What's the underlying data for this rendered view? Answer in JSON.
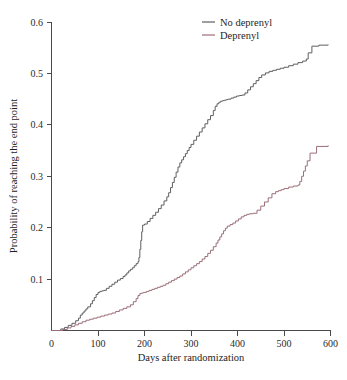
{
  "chart_data": {
    "type": "line",
    "title": "",
    "subtitle": "",
    "xlabel": "Days after randomization",
    "ylabel": "Probability of reaching the end point",
    "xlim": [
      0,
      600
    ],
    "ylim": [
      0,
      0.6
    ],
    "xticks": [
      0,
      100,
      200,
      300,
      400,
      500,
      600
    ],
    "xtick_labels": [
      "0",
      "100",
      "200",
      "300",
      "400",
      "500",
      "600"
    ],
    "yticks": [
      0.1,
      0.2,
      0.3,
      0.4,
      0.5,
      0.6
    ],
    "ytick_labels": [
      "0.1",
      "0.2",
      "0.3",
      "0.4",
      "0.5",
      "0.6"
    ],
    "grid": false,
    "legend_position": "top-right",
    "step_type": "post",
    "series": [
      {
        "name": "No deprenyl",
        "color": "#5f5f63",
        "x": [
          0,
          20,
          28,
          36,
          44,
          52,
          58,
          62,
          66,
          70,
          74,
          78,
          84,
          88,
          92,
          96,
          100,
          104,
          108,
          112,
          118,
          124,
          130,
          136,
          142,
          148,
          154,
          158,
          162,
          166,
          170,
          174,
          178,
          182,
          186,
          188,
          190,
          192,
          194,
          196,
          200,
          206,
          212,
          218,
          224,
          230,
          236,
          242,
          248,
          252,
          256,
          260,
          264,
          268,
          272,
          276,
          280,
          284,
          288,
          292,
          296,
          300,
          306,
          312,
          318,
          324,
          330,
          336,
          342,
          348,
          352,
          356,
          360,
          364,
          368,
          372,
          376,
          380,
          386,
          392,
          398,
          404,
          410,
          416,
          422,
          428,
          434,
          440,
          446,
          452,
          460,
          468,
          476,
          484,
          492,
          500,
          510,
          520,
          530,
          540,
          548,
          552,
          560,
          575,
          595
        ],
        "y": [
          0.0,
          0.003,
          0.006,
          0.01,
          0.014,
          0.019,
          0.024,
          0.03,
          0.034,
          0.038,
          0.042,
          0.046,
          0.052,
          0.058,
          0.064,
          0.07,
          0.074,
          0.076,
          0.077,
          0.078,
          0.082,
          0.086,
          0.09,
          0.094,
          0.098,
          0.101,
          0.105,
          0.108,
          0.112,
          0.116,
          0.119,
          0.122,
          0.126,
          0.13,
          0.134,
          0.142,
          0.158,
          0.175,
          0.192,
          0.205,
          0.207,
          0.212,
          0.218,
          0.224,
          0.23,
          0.237,
          0.244,
          0.252,
          0.26,
          0.268,
          0.278,
          0.288,
          0.298,
          0.308,
          0.318,
          0.326,
          0.332,
          0.338,
          0.344,
          0.35,
          0.356,
          0.362,
          0.37,
          0.378,
          0.386,
          0.394,
          0.402,
          0.41,
          0.418,
          0.428,
          0.436,
          0.441,
          0.444,
          0.446,
          0.447,
          0.448,
          0.449,
          0.45,
          0.452,
          0.454,
          0.456,
          0.457,
          0.458,
          0.462,
          0.468,
          0.474,
          0.48,
          0.486,
          0.492,
          0.497,
          0.501,
          0.504,
          0.506,
          0.508,
          0.51,
          0.512,
          0.515,
          0.518,
          0.521,
          0.524,
          0.528,
          0.54,
          0.553,
          0.555,
          0.556
        ]
      },
      {
        "name": "Deprenyl",
        "color": "#9b6f78",
        "x": [
          0,
          24,
          34,
          42,
          50,
          58,
          66,
          74,
          82,
          90,
          98,
          106,
          114,
          122,
          130,
          138,
          146,
          154,
          162,
          170,
          176,
          182,
          186,
          190,
          194,
          198,
          204,
          210,
          216,
          222,
          228,
          234,
          240,
          246,
          252,
          258,
          264,
          270,
          276,
          282,
          288,
          294,
          300,
          306,
          312,
          318,
          324,
          330,
          336,
          342,
          348,
          354,
          358,
          362,
          366,
          370,
          374,
          378,
          384,
          390,
          396,
          402,
          408,
          414,
          420,
          426,
          434,
          442,
          450,
          458,
          466,
          474,
          482,
          488,
          494,
          500,
          510,
          520,
          530,
          534,
          538,
          542,
          546,
          550,
          556,
          570,
          595
        ],
        "y": [
          0.0,
          0.002,
          0.005,
          0.008,
          0.011,
          0.014,
          0.017,
          0.02,
          0.022,
          0.024,
          0.026,
          0.028,
          0.03,
          0.032,
          0.034,
          0.037,
          0.04,
          0.043,
          0.046,
          0.05,
          0.056,
          0.062,
          0.068,
          0.072,
          0.073,
          0.074,
          0.076,
          0.078,
          0.08,
          0.082,
          0.084,
          0.086,
          0.088,
          0.091,
          0.094,
          0.097,
          0.1,
          0.103,
          0.106,
          0.11,
          0.114,
          0.118,
          0.122,
          0.126,
          0.13,
          0.134,
          0.139,
          0.144,
          0.15,
          0.156,
          0.163,
          0.17,
          0.176,
          0.182,
          0.188,
          0.194,
          0.199,
          0.203,
          0.206,
          0.209,
          0.213,
          0.217,
          0.221,
          0.224,
          0.226,
          0.227,
          0.228,
          0.234,
          0.242,
          0.25,
          0.258,
          0.266,
          0.27,
          0.272,
          0.274,
          0.276,
          0.279,
          0.281,
          0.283,
          0.29,
          0.3,
          0.31,
          0.32,
          0.33,
          0.345,
          0.358,
          0.36
        ]
      }
    ],
    "legend": [
      {
        "label": "No deprenyl",
        "color": "#5f5f63"
      },
      {
        "label": "Deprenyl",
        "color": "#9b6f78"
      }
    ]
  },
  "axes": {
    "x_title": "Days after randomization",
    "y_title": "Probability of reaching the end point"
  }
}
